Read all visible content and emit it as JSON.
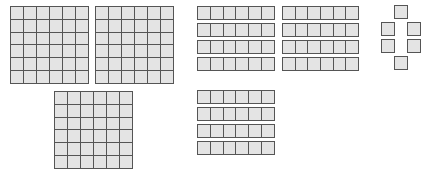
{
  "colors": {
    "cell_fill": "#e4e4e4",
    "cell_border": "#555555",
    "background": "#ffffff"
  },
  "squares": [
    {
      "id": "square-1",
      "rows": 6,
      "cols": 6,
      "x": 10,
      "y": 6,
      "w": 79,
      "h": 78
    },
    {
      "id": "square-2",
      "rows": 6,
      "cols": 6,
      "x": 95,
      "y": 6,
      "w": 79,
      "h": 78
    },
    {
      "id": "square-3",
      "rows": 6,
      "cols": 6,
      "x": 54,
      "y": 91,
      "w": 79,
      "h": 78
    }
  ],
  "strips": [
    {
      "id": "strip-group-1",
      "count": 4,
      "cols": 6,
      "x": 197,
      "y": 6,
      "w": 78,
      "h": 14,
      "spacing": 17
    },
    {
      "id": "strip-group-2",
      "count": 4,
      "cols": 6,
      "x": 282,
      "y": 6,
      "w": 77,
      "h": 14,
      "spacing": 17
    },
    {
      "id": "strip-group-3",
      "count": 4,
      "cols": 6,
      "x": 197,
      "y": 90,
      "w": 78,
      "h": 14,
      "spacing": 17
    }
  ],
  "units": [
    {
      "x": 394,
      "y": 5
    },
    {
      "x": 381,
      "y": 22
    },
    {
      "x": 407,
      "y": 22
    },
    {
      "x": 381,
      "y": 39
    },
    {
      "x": 407,
      "y": 39
    },
    {
      "x": 394,
      "y": 56
    }
  ],
  "summary": {
    "squares_count": 3,
    "strips_count": 12,
    "units_count": 6
  }
}
